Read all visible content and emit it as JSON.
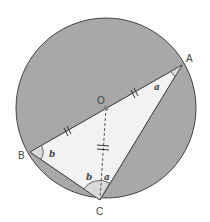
{
  "diagram": {
    "type": "circle-geometry",
    "colors": {
      "circle_fill": "#a8a8a8",
      "triangle_fill": "#f2f2f2",
      "angle_fill": "#d9d9d9",
      "stroke": "#333333"
    },
    "points": {
      "A": {
        "label": "A",
        "x": 182,
        "y": 65
      },
      "B": {
        "label": "B",
        "x": 30,
        "y": 152
      },
      "C": {
        "label": "C",
        "x": 100,
        "y": 200
      },
      "O": {
        "label": "O",
        "x": 106,
        "y": 108
      }
    },
    "angles": {
      "at_A": "a",
      "at_B": "b",
      "at_C_left": "b",
      "at_C_right": "a"
    },
    "equal_segments": [
      "OA",
      "OB",
      "OC"
    ]
  }
}
